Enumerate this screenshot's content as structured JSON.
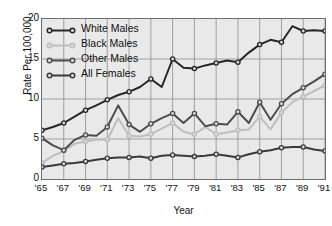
{
  "chart_data": {
    "type": "line",
    "title": "",
    "xlabel": "Year",
    "ylabel": "Rate Per 100,000",
    "grid": true,
    "legend_position": "top-left",
    "xlim": [
      1965,
      1991
    ],
    "ylim": [
      0,
      20
    ],
    "yticks": [
      0,
      5,
      10,
      15,
      20
    ],
    "ytick_labels": [
      "0",
      "5",
      "10",
      "15",
      "20"
    ],
    "xticks": [
      1965,
      1967,
      1969,
      1971,
      1973,
      1975,
      1977,
      1979,
      1981,
      1983,
      1985,
      1987,
      1989,
      1991
    ],
    "xtick_labels": [
      "'65",
      "'67",
      "'69",
      "'71",
      "'73",
      "'75",
      "'77",
      "'79",
      "'81",
      "'83",
      "'85",
      "'87",
      "'89",
      "'91"
    ],
    "x": [
      1965,
      1966,
      1967,
      1968,
      1969,
      1970,
      1971,
      1972,
      1973,
      1974,
      1975,
      1976,
      1977,
      1978,
      1979,
      1980,
      1981,
      1982,
      1983,
      1984,
      1985,
      1986,
      1987,
      1988,
      1989,
      1990,
      1991
    ],
    "series": [
      {
        "name": "White Males",
        "color": "#262626",
        "values": [
          6.1,
          6.5,
          7.0,
          7.8,
          8.6,
          9.2,
          9.9,
          10.5,
          10.9,
          11.5,
          12.5,
          11.5,
          15.0,
          13.9,
          13.8,
          14.2,
          14.5,
          14.8,
          14.6,
          15.8,
          16.8,
          17.4,
          17.1,
          19.1,
          18.5,
          18.6,
          18.5
        ]
      },
      {
        "name": "Black Males",
        "color": "#bebebe",
        "values": [
          2.0,
          2.9,
          3.5,
          4.4,
          4.7,
          4.9,
          4.9,
          7.6,
          5.4,
          5.3,
          5.6,
          6.3,
          7.0,
          5.9,
          5.6,
          6.5,
          5.6,
          5.8,
          6.1,
          6.2,
          7.8,
          6.2,
          8.3,
          9.6,
          10.3,
          11.0,
          11.7
        ]
      },
      {
        "name": "Other Males",
        "color": "#4d4d4d",
        "values": [
          5.1,
          4.2,
          3.6,
          4.9,
          5.5,
          5.4,
          6.5,
          9.2,
          6.8,
          5.9,
          6.9,
          7.6,
          8.2,
          7.0,
          8.2,
          6.6,
          6.9,
          6.8,
          8.4,
          7.0,
          9.6,
          7.4,
          9.4,
          10.6,
          11.4,
          12.2,
          13.1
        ]
      },
      {
        "name": "All Females",
        "color": "#3a3a3a",
        "values": [
          1.5,
          1.7,
          1.9,
          2.0,
          2.2,
          2.4,
          2.6,
          2.7,
          2.7,
          2.8,
          2.6,
          2.9,
          3.0,
          2.9,
          2.8,
          2.9,
          3.1,
          2.9,
          2.7,
          3.1,
          3.4,
          3.6,
          3.9,
          4.0,
          4.0,
          3.7,
          3.5
        ]
      }
    ]
  },
  "legend": {
    "items": [
      {
        "label": "White Males",
        "color": "#262626"
      },
      {
        "label": "Black Males",
        "color": "#bebebe"
      },
      {
        "label": "Other Males",
        "color": "#4d4d4d"
      },
      {
        "label": "All Females",
        "color": "#3a3a3a"
      }
    ]
  }
}
